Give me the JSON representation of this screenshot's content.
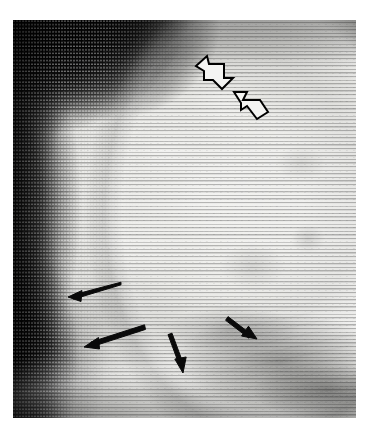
{
  "figure": {
    "kind": "radiograph",
    "modality_label": "mammogram",
    "view_note": "mediolateral-oblique breast radiograph, halftone print reproduction",
    "visible_text": "",
    "caption": "",
    "page_background": "#ffffff",
    "plate": {
      "x": 13,
      "y": 20,
      "width": 343,
      "height": 398,
      "dark_background_color": "#050505",
      "mid_tissue_color": "#c9c9c6",
      "bright_tissue_color": "#f0f0ee",
      "film_edge_color": "#e9e9e6"
    },
    "texture": {
      "name": "halftone-scanlines",
      "line_spacing_px": 3.6,
      "orientation": "horizontal"
    }
  },
  "annotations": {
    "summary": "two open block arrows marking an upper finding and four solid line arrows outlining a lower contour",
    "stroke_color": "#000000",
    "hollow_fill_color": "#f4f4f2",
    "hollow_arrows": [
      {
        "name": "hollow-arrow-upper-left",
        "label": "",
        "direction": "down-right",
        "tip": [
          224,
          86
        ],
        "tail": [
          196,
          60
        ],
        "points": "196,66 207,56 209,64 224,64 224,78 233,78 222,89 213,80 204,80 204,71"
      },
      {
        "name": "hollow-arrow-lower-right",
        "label": "",
        "direction": "up-left",
        "tip": [
          234,
          92
        ],
        "tail": [
          268,
          120
        ],
        "points": "234,92 247,92 243,100 260,100 268,112 257,119 247,106 241,110 241,103"
      }
    ],
    "line_arrows": [
      {
        "name": "line-arrow-left-upper",
        "label": "",
        "direction": "left",
        "tail": [
          121,
          283
        ],
        "tip": [
          68,
          297
        ],
        "length_px": 55
      },
      {
        "name": "line-arrow-left-lower",
        "label": "",
        "direction": "down-left",
        "tail": [
          144,
          326
        ],
        "tip": [
          84,
          347
        ],
        "length_px": 64
      },
      {
        "name": "line-arrow-center-down",
        "label": "",
        "direction": "down-right",
        "tail": [
          169,
          334
        ],
        "tip": [
          183,
          373
        ],
        "length_px": 41
      },
      {
        "name": "line-arrow-right",
        "label": "",
        "direction": "down-right",
        "tail": [
          228,
          318
        ],
        "tip": [
          257,
          339
        ],
        "length_px": 36
      }
    ]
  }
}
